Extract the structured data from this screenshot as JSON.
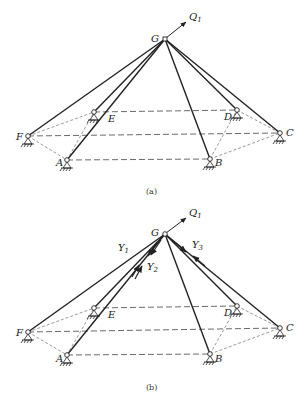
{
  "figure": {
    "panels": [
      {
        "id": "a",
        "caption": "(a)",
        "apex_label": "G",
        "force_label": "Q",
        "force_sub": "1",
        "nodes": {
          "G": {
            "label": "G",
            "x": 165,
            "y": 39
          },
          "F": {
            "label": "F",
            "x": 28,
            "y": 136
          },
          "E": {
            "label": "E",
            "x": 94,
            "y": 112
          },
          "A": {
            "label": "A",
            "x": 67,
            "y": 160
          },
          "B": {
            "label": "B",
            "x": 210,
            "y": 159
          },
          "D": {
            "label": "D",
            "x": 237,
            "y": 110
          },
          "C": {
            "label": "C",
            "x": 280,
            "y": 133
          }
        }
      },
      {
        "id": "b",
        "caption": "(b)",
        "apex_label": "G",
        "force_label": "Q",
        "force_sub": "1",
        "reaction_labels": [
          {
            "label": "Y",
            "sub": "1"
          },
          {
            "label": "Y",
            "sub": "2"
          },
          {
            "label": "Y",
            "sub": "3"
          }
        ],
        "nodes": {
          "G": {
            "label": "G",
            "x": 165,
            "y": 234
          },
          "F": {
            "label": "F",
            "x": 28,
            "y": 332
          },
          "E": {
            "label": "E",
            "x": 94,
            "y": 308
          },
          "A": {
            "label": "A",
            "x": 67,
            "y": 355
          },
          "B": {
            "label": "B",
            "x": 210,
            "y": 354
          },
          "D": {
            "label": "D",
            "x": 237,
            "y": 306
          },
          "C": {
            "label": "C",
            "x": 280,
            "y": 328
          }
        }
      }
    ],
    "labels": {
      "A": "A",
      "B": "B",
      "C": "C",
      "D": "D",
      "E": "E",
      "F": "F",
      "G": "G",
      "Q": "Q",
      "Q_sub": "1",
      "Y": "Y",
      "Y1_sub": "1",
      "Y2_sub": "2",
      "Y3_sub": "3",
      "cap_a": "(a)",
      "cap_b": "(b)"
    }
  }
}
